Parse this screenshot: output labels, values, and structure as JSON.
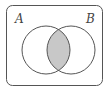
{
  "diagram": {
    "type": "venn",
    "sets": [
      {
        "label": "A",
        "cx": 46,
        "cy": 50,
        "r": 24
      },
      {
        "label": "B",
        "cx": 71,
        "cy": 50,
        "r": 24
      }
    ],
    "shaded_region": "A ∩ B",
    "colors": {
      "stroke": "#555555",
      "shade": "#c8c8c8",
      "background": "#ffffff"
    }
  }
}
